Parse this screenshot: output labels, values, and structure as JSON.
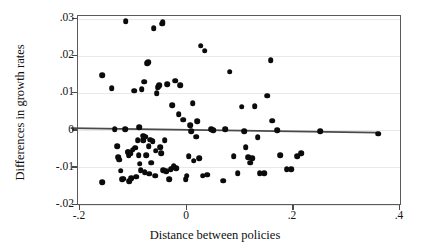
{
  "chart_data": {
    "type": "scatter",
    "title": "",
    "xlabel": "Distance between policies",
    "ylabel": "Differences in growth rates",
    "xlim": [
      -0.2157,
      0.4037
    ],
    "ylim": [
      -0.0225,
      0.0325
    ],
    "xticks": [
      -0.2,
      0,
      0.2,
      0.4
    ],
    "xticklabels": [
      "-.2",
      "0",
      ".2",
      ".4"
    ],
    "yticks": [
      0.03,
      0.02,
      0.01,
      0,
      -0.01,
      -0.02
    ],
    "yticklabels": [
      ".03",
      ".02",
      ".01",
      "0",
      "-.01",
      "-.02"
    ],
    "grid": "horizontal",
    "legend": "none",
    "marker": "filled-circle",
    "marker_color": "#0b0b0b",
    "fit_line": {
      "label": "linear fit",
      "color": "#4a4a4a",
      "x_start": -0.2157,
      "y_start": 0.0003,
      "x_end": 0.3608,
      "y_end": -0.00092
    },
    "points": [
      [
        -0.157,
        0.0145
      ],
      [
        -0.1565,
        -0.0142
      ],
      [
        -0.139,
        0.011
      ],
      [
        -0.133,
        0.0
      ],
      [
        -0.1285,
        -0.0045
      ],
      [
        -0.127,
        -0.0075
      ],
      [
        -0.1245,
        -0.0082
      ],
      [
        -0.1215,
        -0.0112
      ],
      [
        -0.119,
        -0.0135
      ],
      [
        -0.116,
        -0.0133
      ],
      [
        -0.113,
        0.0
      ],
      [
        -0.112,
        0.029
      ],
      [
        -0.109,
        -0.006
      ],
      [
        -0.108,
        -0.0062
      ],
      [
        -0.107,
        -0.007
      ],
      [
        -0.106,
        -0.014
      ],
      [
        -0.103,
        -0.0065
      ],
      [
        -0.102,
        -0.0132
      ],
      [
        -0.099,
        -0.0055
      ],
      [
        -0.096,
        0.0103
      ],
      [
        -0.095,
        -0.005
      ],
      [
        -0.093,
        -0.0128
      ],
      [
        -0.09,
        -0.003
      ],
      [
        -0.088,
        -0.007
      ],
      [
        -0.087,
        0.0005
      ],
      [
        -0.086,
        -0.0093
      ],
      [
        -0.084,
        -0.011
      ],
      [
        -0.082,
        0.0108
      ],
      [
        -0.08,
        -0.003
      ],
      [
        -0.079,
        -0.0018
      ],
      [
        -0.078,
        0.0128
      ],
      [
        -0.077,
        -0.0115
      ],
      [
        -0.0755,
        -0.002
      ],
      [
        -0.074,
        -0.007
      ],
      [
        -0.072,
        0.0178
      ],
      [
        -0.07,
        0.018
      ],
      [
        -0.069,
        -0.0045
      ],
      [
        -0.068,
        -0.012
      ],
      [
        -0.066,
        -0.0028
      ],
      [
        -0.065,
        -0.009
      ],
      [
        -0.062,
        -0.0032
      ],
      [
        -0.06,
        0.0272
      ],
      [
        -0.057,
        -0.0125
      ],
      [
        -0.056,
        -0.0058
      ],
      [
        -0.054,
        0.0096
      ],
      [
        -0.052,
        0.0113
      ],
      [
        -0.0505,
        0.0116
      ],
      [
        -0.049,
        0.0119
      ],
      [
        -0.048,
        -0.0048
      ],
      [
        -0.046,
        -0.0065
      ],
      [
        -0.044,
        0.0284
      ],
      [
        -0.043,
        0.0288
      ],
      [
        -0.042,
        -0.011
      ],
      [
        -0.039,
        -0.003
      ],
      [
        -0.036,
        -0.0113
      ],
      [
        -0.034,
        0.0121
      ],
      [
        -0.031,
        -0.0135
      ],
      [
        -0.028,
        -0.0108
      ],
      [
        -0.025,
        0.0064
      ],
      [
        -0.023,
        -0.0104
      ],
      [
        -0.022,
        -0.01
      ],
      [
        -0.02,
        0.013
      ],
      [
        -0.018,
        -0.0105
      ],
      [
        -0.013,
        0.0041
      ],
      [
        -0.01,
        0.0118
      ],
      [
        -0.005,
        0.0025
      ],
      [
        0.0,
        -0.0135
      ],
      [
        0.002,
        -0.0125
      ],
      [
        0.006,
        -0.0072
      ],
      [
        0.009,
        0.001
      ],
      [
        0.011,
        -0.0005
      ],
      [
        0.013,
        0.007
      ],
      [
        0.015,
        -0.0085
      ],
      [
        0.02,
        -0.002
      ],
      [
        0.022,
        0.0022
      ],
      [
        0.025,
        -0.0078
      ],
      [
        0.028,
        0.0224
      ],
      [
        0.032,
        -0.0125
      ],
      [
        0.036,
        0.0211
      ],
      [
        0.04,
        -0.0122
      ],
      [
        0.048,
        0.0
      ],
      [
        0.052,
        -0.0002
      ],
      [
        0.07,
        -0.0138
      ],
      [
        0.074,
        0.0
      ],
      [
        0.083,
        0.0155
      ],
      [
        0.09,
        -0.0073
      ],
      [
        0.098,
        -0.0118
      ],
      [
        0.105,
        0.006
      ],
      [
        0.11,
        -0.0005
      ],
      [
        0.113,
        -0.0048
      ],
      [
        0.118,
        -0.0075
      ],
      [
        0.121,
        -0.009
      ],
      [
        0.125,
        -0.0078
      ],
      [
        0.13,
        0.0062
      ],
      [
        0.135,
        -0.0022
      ],
      [
        0.139,
        -0.0118
      ],
      [
        0.147,
        -0.0118
      ],
      [
        0.153,
        0.009
      ],
      [
        0.16,
        0.0186
      ],
      [
        0.162,
        0.0023
      ],
      [
        0.172,
        -0.0002
      ],
      [
        0.178,
        -0.007
      ],
      [
        0.19,
        -0.0108
      ],
      [
        0.198,
        -0.0108
      ],
      [
        0.209,
        -0.0072
      ],
      [
        0.217,
        -0.0065
      ],
      [
        0.253,
        -0.0005
      ],
      [
        0.361,
        -0.0012
      ]
    ]
  }
}
